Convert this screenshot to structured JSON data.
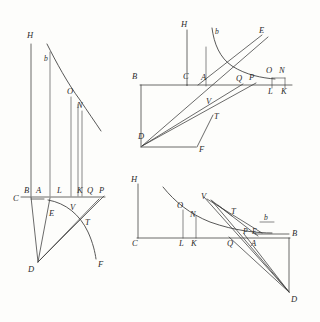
{
  "plate": {
    "title": "Geometric construction plate",
    "background_color": "#fdfdfb",
    "ink_color": "#3a3a3a",
    "label_color": "#2b2b2b",
    "figure_count": 3
  },
  "figures": [
    {
      "id": "figure-left",
      "name": "upper-lower-left-figure",
      "labels": [
        {
          "id": "fl-H",
          "text": "H",
          "x": 27,
          "y": 38
        },
        {
          "id": "fl-b",
          "text": "b",
          "x": 47,
          "y": 60
        },
        {
          "id": "fl-O",
          "text": "O",
          "x": 70,
          "y": 93
        },
        {
          "id": "fl-N",
          "text": "N",
          "x": 79,
          "y": 107
        },
        {
          "id": "fl-C",
          "text": "C",
          "x": 14,
          "y": 199
        },
        {
          "id": "fl-B",
          "text": "B",
          "x": 25,
          "y": 192
        },
        {
          "id": "fl-A",
          "text": "A",
          "x": 37,
          "y": 192
        },
        {
          "id": "fl-L",
          "text": "L",
          "x": 58,
          "y": 192
        },
        {
          "id": "fl-K",
          "text": "K",
          "x": 79,
          "y": 192
        },
        {
          "id": "fl-Q",
          "text": "Q",
          "x": 89,
          "y": 192
        },
        {
          "id": "fl-P",
          "text": "P",
          "x": 101,
          "y": 192
        },
        {
          "id": "fl-E",
          "text": "E",
          "x": 51,
          "y": 214
        },
        {
          "id": "fl-V",
          "text": "V",
          "x": 72,
          "y": 208
        },
        {
          "id": "fl-T",
          "text": "T",
          "x": 86,
          "y": 223
        },
        {
          "id": "fl-D",
          "text": "D",
          "x": 29,
          "y": 269
        },
        {
          "id": "fl-F",
          "text": "F",
          "x": 99,
          "y": 265
        }
      ]
    },
    {
      "id": "figure-top-right",
      "name": "top-right-figure",
      "labels": [
        {
          "id": "tr-H",
          "text": "H",
          "x": 182,
          "y": 26
        },
        {
          "id": "tr-b",
          "text": "b",
          "x": 216,
          "y": 33
        },
        {
          "id": "tr-E",
          "text": "E",
          "x": 261,
          "y": 32
        },
        {
          "id": "tr-B",
          "text": "B",
          "x": 133,
          "y": 77
        },
        {
          "id": "tr-C",
          "text": "C",
          "x": 185,
          "y": 77
        },
        {
          "id": "tr-A",
          "text": "A",
          "x": 203,
          "y": 78
        },
        {
          "id": "tr-Q",
          "text": "Q",
          "x": 238,
          "y": 79
        },
        {
          "id": "tr-P",
          "text": "P",
          "x": 251,
          "y": 78
        },
        {
          "id": "tr-O",
          "text": "O",
          "x": 268,
          "y": 71
        },
        {
          "id": "tr-N",
          "text": "N",
          "x": 281,
          "y": 71
        },
        {
          "id": "tr-L",
          "text": "L",
          "x": 269,
          "y": 91
        },
        {
          "id": "tr-K",
          "text": "K",
          "x": 282,
          "y": 91
        },
        {
          "id": "tr-V",
          "text": "V",
          "x": 208,
          "y": 102
        },
        {
          "id": "tr-T",
          "text": "T",
          "x": 216,
          "y": 117
        },
        {
          "id": "tr-D",
          "text": "D",
          "x": 140,
          "y": 137
        },
        {
          "id": "tr-F",
          "text": "F",
          "x": 200,
          "y": 150
        }
      ]
    },
    {
      "id": "figure-bottom-right",
      "name": "bottom-right-figure",
      "labels": [
        {
          "id": "br-H",
          "text": "H",
          "x": 132,
          "y": 180
        },
        {
          "id": "br-O",
          "text": "O",
          "x": 180,
          "y": 206
        },
        {
          "id": "br-V",
          "text": "V",
          "x": 203,
          "y": 198
        },
        {
          "id": "br-N",
          "text": "N",
          "x": 193,
          "y": 214
        },
        {
          "id": "br-T",
          "text": "T",
          "x": 232,
          "y": 212
        },
        {
          "id": "br-b",
          "text": "b",
          "x": 265,
          "y": 218
        },
        {
          "id": "br-P",
          "text": "P",
          "x": 245,
          "y": 232
        },
        {
          "id": "br-E",
          "text": "E",
          "x": 254,
          "y": 232
        },
        {
          "id": "br-C",
          "text": "C",
          "x": 134,
          "y": 243
        },
        {
          "id": "br-L",
          "text": "L",
          "x": 180,
          "y": 243
        },
        {
          "id": "br-K",
          "text": "K",
          "x": 192,
          "y": 243
        },
        {
          "id": "br-Q",
          "text": "Q",
          "x": 229,
          "y": 243
        },
        {
          "id": "br-A",
          "text": "A",
          "x": 253,
          "y": 243
        },
        {
          "id": "br-B",
          "text": "B",
          "x": 290,
          "y": 234
        },
        {
          "id": "br-D",
          "text": "D",
          "x": 292,
          "y": 299
        }
      ]
    }
  ]
}
